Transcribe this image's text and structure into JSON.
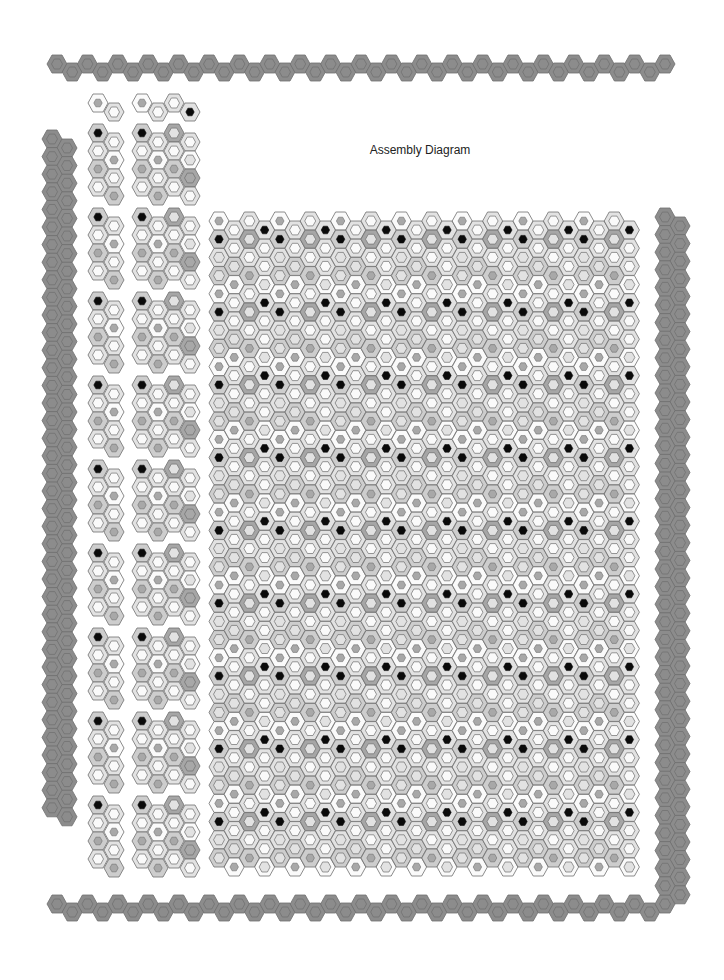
{
  "title": "Assembly Diagram",
  "colors": {
    "stroke": "#6e6e6e",
    "strip_fill": "#8c8c8c",
    "strip_inner": "#8c8c8c",
    "white": "#fafafa",
    "light": "#e2e2e2",
    "mid": "#cdcdcd",
    "dark": "#a6a6a6",
    "dot_mid": "#a8a8a8",
    "dot_light": "#e6e6e6",
    "black": "#0a0a0a"
  },
  "hex": {
    "w": 20,
    "h": 18
  },
  "top_strip": {
    "x0": 57,
    "y_up": 64,
    "y_down": 72,
    "pitch": 15.2,
    "count": 41
  },
  "bottom_strip": {
    "x0": 57,
    "y_up": 904,
    "y_down": 912,
    "pitch": 15.2,
    "count": 41
  },
  "left_strip": {
    "x_cols": [
      52,
      67
    ],
    "y0": 139,
    "offset": 9,
    "pitch": 17.6,
    "rows": 39
  },
  "right_strip": {
    "x_cols": [
      665,
      680
    ],
    "y0": 217,
    "offset": 9,
    "pitch": 17.6,
    "rows": 39
  },
  "main_grid": {
    "x0": 219,
    "y0": 221,
    "col_pitch": 15.2,
    "row_pitch": 18.2,
    "cols": 28,
    "rows": 36,
    "odd_offset": 9
  },
  "left_panels": {
    "header": {
      "y": 103
    },
    "y_starts": [
      133,
      217,
      301,
      385,
      469,
      553,
      637,
      721,
      805
    ],
    "narrow_x": [
      98,
      114
    ],
    "wide_x": [
      142,
      158,
      174,
      190
    ],
    "rows": 4,
    "row_pitch": 18,
    "odd_offset": 9
  }
}
